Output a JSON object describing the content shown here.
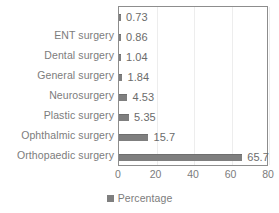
{
  "chart_data": {
    "type": "bar",
    "orientation": "horizontal",
    "title": "",
    "xlabel": "",
    "ylabel": "",
    "categories": [
      "",
      "ENT surgery",
      "Dental surgery",
      "General surgery",
      "Neurosurgery",
      "Plastic surgery",
      "Ophthalmic surgery",
      "Orthopaedic surgery"
    ],
    "values": [
      0.73,
      0.86,
      1.04,
      1.84,
      4.53,
      5.35,
      15.7,
      65.7
    ],
    "value_labels": [
      "0.73",
      "0.86",
      "1.04",
      "1.84",
      "4.53",
      "5.35",
      "15.7",
      "65.7"
    ],
    "xlim": [
      0,
      80
    ],
    "xticks": [
      0,
      20,
      40,
      60,
      80
    ],
    "xtick_labels": [
      "0",
      "20",
      "40",
      "60",
      "80"
    ],
    "grid": true,
    "legend": {
      "position": "bottom",
      "entries": [
        {
          "label": "Percentage",
          "color": "#7f7f7f",
          "marker": "square"
        }
      ]
    },
    "series": [
      {
        "name": "Percentage",
        "color": "#7f7f7f",
        "values": [
          0.73,
          0.86,
          1.04,
          1.84,
          4.53,
          5.35,
          15.7,
          65.7
        ]
      }
    ]
  },
  "colors": {
    "bar": "#7f7f7f",
    "text": "#7c7c7c",
    "gridline": "#ededed",
    "frame": "#8d8d8d",
    "background": "#ffffff"
  }
}
